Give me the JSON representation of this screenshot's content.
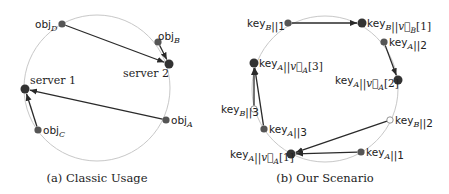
{
  "colors": {
    "ring": "#c8c8c8",
    "edge": "#2a2a2a",
    "node": "#333333",
    "small_node": "#555555",
    "open_node_fill": "#ffffff"
  },
  "panels": [
    {
      "id": "a",
      "caption": "(a) Classic Usage",
      "ring": {
        "cx": 97,
        "cy": 88,
        "r": 73
      },
      "nodes": [
        {
          "id": "objD",
          "label": "obj",
          "sub": "D",
          "x": 62,
          "y": 24,
          "size": "small",
          "lx": 35,
          "ly": 28,
          "anchor": "start"
        },
        {
          "id": "objB",
          "label": "obj",
          "sub": "B",
          "x": 158,
          "y": 42,
          "size": "small",
          "lx": 158,
          "ly": 40,
          "anchor": "start"
        },
        {
          "id": "server2",
          "label": "server 2",
          "sub": "",
          "x": 169,
          "y": 64,
          "size": "large",
          "lx": 123,
          "ly": 77,
          "anchor": "start",
          "serif": true
        },
        {
          "id": "server1",
          "label": "server 1",
          "sub": "",
          "x": 25,
          "y": 89,
          "size": "large",
          "lx": 30,
          "ly": 84,
          "anchor": "start",
          "serif": true
        },
        {
          "id": "objA",
          "label": "obj",
          "sub": "A",
          "x": 166,
          "y": 120,
          "size": "small",
          "lx": 171,
          "ly": 124,
          "anchor": "start"
        },
        {
          "id": "objC",
          "label": "obj",
          "sub": "C",
          "x": 38,
          "y": 130,
          "size": "small",
          "lx": 43,
          "ly": 134,
          "anchor": "start"
        }
      ],
      "edges": [
        {
          "from": "objD",
          "to": "server2"
        },
        {
          "from": "objB",
          "to": "server2"
        },
        {
          "from": "objA",
          "to": "server1"
        },
        {
          "from": "objC",
          "to": "server1"
        }
      ]
    },
    {
      "id": "b",
      "caption": "(b) Our Scenario",
      "ring": {
        "cx": 325,
        "cy": 89,
        "r": 73
      },
      "nodes": [
        {
          "id": "kB1",
          "label": "key",
          "sub": "B",
          "tail": "||1",
          "x": 288,
          "y": 23,
          "size": "small",
          "lx": 247,
          "ly": 27,
          "anchor": "start"
        },
        {
          "id": "kBv1",
          "label": "key",
          "sub": "B",
          "tail": "||v⃗",
          "vsub": "B",
          "idx": "[1]",
          "x": 362,
          "y": 23,
          "size": "large",
          "lx": 367,
          "ly": 27,
          "anchor": "start"
        },
        {
          "id": "kA2",
          "label": "key",
          "sub": "A",
          "tail": "||2",
          "x": 384,
          "y": 42,
          "size": "small",
          "lx": 389,
          "ly": 46,
          "anchor": "start"
        },
        {
          "id": "kAv3",
          "label": "key",
          "sub": "A",
          "tail": "||v⃗",
          "vsub": "A",
          "idx": "[3]",
          "x": 254,
          "y": 63,
          "size": "large",
          "lx": 259,
          "ly": 67,
          "anchor": "start"
        },
        {
          "id": "kAv2",
          "label": "key",
          "sub": "A",
          "tail": "||v⃗",
          "vsub": "A",
          "idx": "[2]",
          "x": 398,
          "y": 80,
          "size": "large",
          "lx": 335,
          "ly": 84,
          "anchor": "start"
        },
        {
          "id": "kB3",
          "label": "key",
          "sub": "B",
          "tail": "||3",
          "x": 254,
          "y": 109,
          "size": "open",
          "lx": 221,
          "ly": 113,
          "anchor": "start"
        },
        {
          "id": "kB2",
          "label": "key",
          "sub": "B",
          "tail": "||2",
          "x": 390,
          "y": 120,
          "size": "open",
          "lx": 395,
          "ly": 124,
          "anchor": "start"
        },
        {
          "id": "kA3",
          "label": "key",
          "sub": "A",
          "tail": "||3",
          "x": 264,
          "y": 129,
          "size": "small",
          "lx": 269,
          "ly": 133,
          "anchor": "start"
        },
        {
          "id": "kAv1",
          "label": "key",
          "sub": "A",
          "tail": "||v⃗",
          "vsub": "A",
          "idx": "[1]",
          "x": 291,
          "y": 154,
          "size": "large",
          "lx": 230,
          "ly": 158,
          "anchor": "start"
        },
        {
          "id": "kA1",
          "label": "key",
          "sub": "A",
          "tail": "||1",
          "x": 361,
          "y": 152,
          "size": "small",
          "lx": 366,
          "ly": 156,
          "anchor": "start"
        }
      ],
      "edges": [
        {
          "from": "kB1",
          "to": "kBv1"
        },
        {
          "from": "kA2",
          "to": "kAv2"
        },
        {
          "from": "kB3",
          "to": "kAv3"
        },
        {
          "from": "kA3",
          "to": "kAv3"
        },
        {
          "from": "kB2",
          "to": "kAv1"
        },
        {
          "from": "kA1",
          "to": "kAv1"
        }
      ]
    }
  ]
}
